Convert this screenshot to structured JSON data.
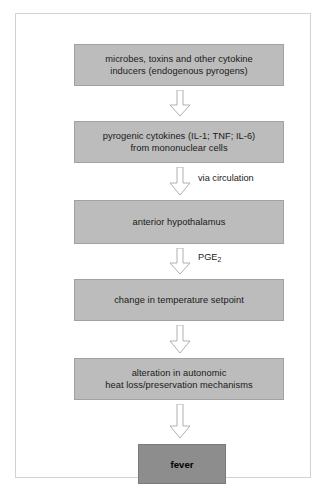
{
  "figure": {
    "frame_color": "#d2d2d2",
    "background_color": "#ffffff"
  },
  "colors": {
    "box_fill": "#bcbcbc",
    "box_border": "#a2a2a2",
    "fever_fill": "#8d8d8d",
    "fever_border": "#7a7a7a",
    "arrow_stroke": "#b0b0b0",
    "arrow_fill": "#ffffff",
    "text": "#1a1a1a"
  },
  "boxes": [
    {
      "id": "inducers",
      "text": "microbes, toxins and other cytokine\ninducers (endogenous pyrogens)"
    },
    {
      "id": "cytokines",
      "text": "pyrogenic cytokines (IL-1; TNF; IL-6)\nfrom mononuclear cells"
    },
    {
      "id": "hypothalamus",
      "text": "anterior hypothalamus"
    },
    {
      "id": "setpoint",
      "text": "change in temperature setpoint"
    },
    {
      "id": "alteration",
      "text": "alteration in autonomic\nheat loss/preservation mechanisms"
    }
  ],
  "outcome": {
    "id": "fever",
    "text": "fever"
  },
  "arrow_labels": {
    "via_circulation": "via circulation",
    "pge2_prefix": "PGE",
    "pge2_subscript": "2"
  },
  "arrows": [
    {
      "id": "arrow-1",
      "from": "inducers",
      "to": "cytokines",
      "label": ""
    },
    {
      "id": "arrow-2",
      "from": "cytokines",
      "to": "hypothalamus",
      "label": "via circulation"
    },
    {
      "id": "arrow-3",
      "from": "hypothalamus",
      "to": "setpoint",
      "label": "PGE2"
    },
    {
      "id": "arrow-4",
      "from": "setpoint",
      "to": "alteration",
      "label": ""
    },
    {
      "id": "arrow-5",
      "from": "alteration",
      "to": "fever",
      "label": ""
    }
  ]
}
